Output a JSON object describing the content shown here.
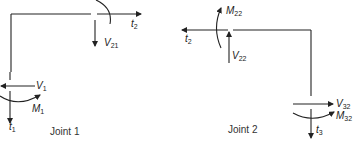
{
  "diagram": {
    "type": "free-body diagram of frame joints",
    "stroke_color": "#222222",
    "background": "#ffffff",
    "joints": [
      {
        "caption": "Joint 1",
        "labels": {
          "t2": {
            "base": "t",
            "sub": "2"
          },
          "V21": {
            "base": "V",
            "sub": "21"
          },
          "V1": {
            "base": "V",
            "sub": "1"
          },
          "M1": {
            "base": "M",
            "sub": "1"
          },
          "t1": {
            "base": "t",
            "sub": "1"
          }
        }
      },
      {
        "caption": "Joint 2",
        "labels": {
          "M22": {
            "base": "M",
            "sub": "22"
          },
          "t2": {
            "base": "t",
            "sub": "2"
          },
          "V22": {
            "base": "V",
            "sub": "22"
          },
          "V32": {
            "base": "V",
            "sub": "32"
          },
          "M32": {
            "base": "M",
            "sub": "32"
          },
          "t3": {
            "base": "t",
            "sub": "3"
          }
        }
      }
    ]
  }
}
